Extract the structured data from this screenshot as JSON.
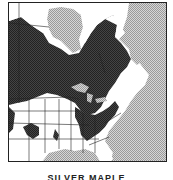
{
  "map": {
    "title": "SILVER MAPLE",
    "region": "Eastern North America",
    "legend": {
      "range_color": "#3a3a3a",
      "water_color": "#c8c8c8",
      "land_color": "#ffffff"
    }
  }
}
